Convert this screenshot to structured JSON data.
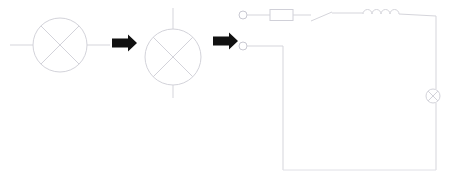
{
  "figure": {
    "title": "Circuit symbol transformation to schematic",
    "background_color": "#ffffff",
    "wire_color": "#d5d5db",
    "arrow_color": "#111111",
    "width": 449,
    "height": 182
  },
  "stages": [
    {
      "id": "stage-1",
      "label": "lamp-symbol-horizontal",
      "symbol": "lamp",
      "orientation": "horizontal",
      "center_x": 60,
      "center_y": 45,
      "radius": 27,
      "lead_start": 10,
      "lead_end": 110
    },
    {
      "id": "stage-2",
      "label": "lamp-symbol-vertical",
      "symbol": "lamp",
      "orientation": "vertical",
      "center_x": 173,
      "center_y": 57,
      "radius": 28,
      "lead_start": 8,
      "lead_end": 98
    }
  ],
  "arrows": [
    {
      "id": "arrow-1",
      "x": 112,
      "y": 43,
      "length": 25,
      "direction": "right"
    },
    {
      "id": "arrow-2",
      "x": 213,
      "y": 41,
      "length": 25,
      "direction": "right"
    }
  ],
  "circuit": {
    "id": "stage-3",
    "label": "series-circuit-schematic",
    "terminals": [
      {
        "name": "terminal-top",
        "cx": 243,
        "cy": 15,
        "r": 4
      },
      {
        "name": "terminal-bottom",
        "cx": 243,
        "cy": 46,
        "r": 4
      }
    ],
    "components": [
      {
        "name": "resistor",
        "type": "resistor",
        "x": 270,
        "y": 9,
        "width": 23,
        "height": 11
      },
      {
        "name": "switch",
        "type": "switch",
        "state": "open",
        "pivot_x": 311,
        "pivot_y": 21,
        "tip_x": 330,
        "tip_y": 13
      },
      {
        "name": "inductor",
        "type": "inductor",
        "coils": 4,
        "start_x": 363,
        "end_x": 399,
        "y": 15,
        "coil_radius": 4.5
      },
      {
        "name": "lamp",
        "type": "lamp",
        "cx": 433,
        "cy": 96,
        "r": 7
      }
    ],
    "loop": {
      "top_y": 15,
      "bottom_y": 170,
      "left_x": 283,
      "right_x": 436,
      "branch_y": 46
    }
  }
}
